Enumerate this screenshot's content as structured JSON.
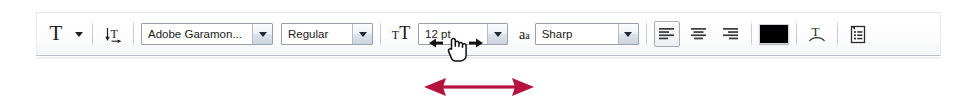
{
  "app": {
    "toolbar_name": "Type tool options bar"
  },
  "toolbar": {
    "tool_preset": {
      "icon": "type-tool-icon",
      "glyph": "T",
      "label": "Tool Preset Picker",
      "caret_icon": "caret-down-icon"
    },
    "orientation": {
      "icon": "toggle-text-orientation-icon",
      "label": "Toggle text orientation"
    },
    "font_family": {
      "label": "Font family",
      "value": "Adobe Garamon...",
      "placeholder": "Font family",
      "dropdown_icon": "chevron-down-icon"
    },
    "font_style": {
      "label": "Font style",
      "value": "Regular",
      "placeholder": "Font style",
      "dropdown_icon": "chevron-down-icon"
    },
    "font_size": {
      "icon": "font-size-icon",
      "icon_small_glyph": "T",
      "icon_large_glyph": "T",
      "label": "Font size",
      "value": "12 pt",
      "placeholder": "Size",
      "dropdown_icon": "chevron-down-icon",
      "scrubby_cursor_icon": "scrubby-slider-cursor"
    },
    "anti_aliasing": {
      "icon": "anti-aliasing-icon",
      "icon_big_glyph": "a",
      "icon_small_glyph": "a",
      "label": "Anti-aliasing method",
      "value": "Sharp",
      "placeholder": "Anti-aliasing",
      "dropdown_icon": "chevron-down-icon"
    },
    "alignment": {
      "label": "Paragraph alignment",
      "options": [
        {
          "name": "align-left",
          "label": "Left align text",
          "selected": true
        },
        {
          "name": "align-center",
          "label": "Center text",
          "selected": false
        },
        {
          "name": "align-right",
          "label": "Right align text",
          "selected": false
        }
      ]
    },
    "color": {
      "icon": "text-color-swatch",
      "label": "Set the text color",
      "value": "#000000"
    },
    "warp": {
      "icon": "warp-text-icon",
      "label": "Create warped text"
    },
    "panels": {
      "icon": "character-paragraph-panels-icon",
      "label": "Toggle the Character and Paragraph panels"
    }
  },
  "annotation": {
    "arrow": {
      "name": "drag-direction-arrow",
      "color": "#b5123e",
      "direction": "horizontal-double"
    }
  }
}
